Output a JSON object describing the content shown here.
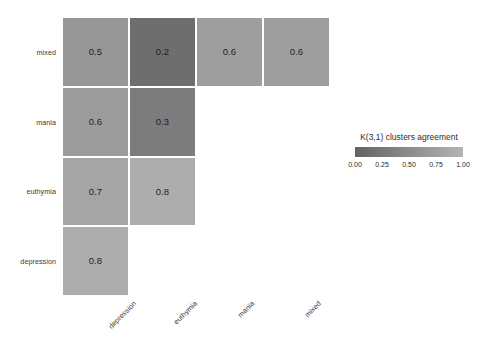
{
  "chart_data": {
    "type": "heatmap",
    "title": "",
    "subtitle": "",
    "xlabel": "",
    "ylabel": "",
    "grid": false,
    "triangular": "lower",
    "x_categories": [
      "depression",
      "euthymia",
      "mania",
      "mixed"
    ],
    "y_categories": [
      "mixed",
      "mania",
      "euthymia",
      "depression"
    ],
    "cells": [
      {
        "row": "mixed",
        "col": "depression",
        "value": 0.5,
        "label": "0.5",
        "color": "#969696"
      },
      {
        "row": "mixed",
        "col": "euthymia",
        "value": 0.2,
        "label": "0.2",
        "color": "#6e6e6e"
      },
      {
        "row": "mixed",
        "col": "mania",
        "value": 0.6,
        "label": "0.6",
        "color": "#9e9e9e"
      },
      {
        "row": "mixed",
        "col": "mixed",
        "value": 0.6,
        "label": "0.6",
        "color": "#9e9e9e"
      },
      {
        "row": "mania",
        "col": "depression",
        "value": 0.6,
        "label": "0.6",
        "color": "#9c9c9c"
      },
      {
        "row": "mania",
        "col": "euthymia",
        "value": 0.3,
        "label": "0.3",
        "color": "#7c7c7c"
      },
      {
        "row": "euthymia",
        "col": "depression",
        "value": 0.7,
        "label": "0.7",
        "color": "#a5a5a5"
      },
      {
        "row": "euthymia",
        "col": "euthymia",
        "value": 0.8,
        "label": "0.8",
        "color": "#adadad"
      },
      {
        "row": "depression",
        "col": "depression",
        "value": 0.8,
        "label": "0.8",
        "color": "#adadad"
      }
    ],
    "legend": {
      "position": "right",
      "title": "K(3,1) clusters agreement",
      "ticks": [
        "0.00",
        "0.25",
        "0.50",
        "0.75",
        "1.00"
      ],
      "tick_values": [
        0.0,
        0.25,
        0.5,
        0.75,
        1.0
      ],
      "range": [
        0.0,
        1.0
      ],
      "gradient_low_color": "#636363",
      "gradient_high_color": "#b4b4b4"
    },
    "colors": {
      "panel_background": "#ffffff",
      "gridline": "#ffffff",
      "text": "#2b2b2b"
    }
  }
}
